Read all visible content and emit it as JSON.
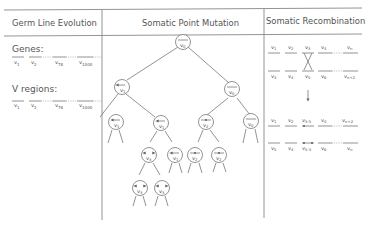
{
  "headers": {
    "germ": "Germ Line Evolution",
    "point": "Somatic Point Mutation",
    "recomb": "Somatic Recombination"
  },
  "germ_line": {
    "genes_label": "Genes:",
    "genes": [
      "v1",
      "v2",
      "v78",
      "v1000"
    ],
    "vregions_label": "V regions:",
    "vregions": [
      "v1",
      "v2",
      "v78",
      "v1000"
    ]
  },
  "point_mutation_tree": {
    "root": {
      "label": "v0",
      "mark": "bar"
    },
    "nodes": [
      {
        "id": "L",
        "label": "v1",
        "mark": "arrow-left"
      },
      {
        "id": "R",
        "label": "v0",
        "mark": "bar"
      },
      {
        "id": "LL",
        "label": "v1",
        "mark": "arrow-left"
      },
      {
        "id": "LR",
        "label": "v1",
        "mark": "arrow-left"
      },
      {
        "id": "RL",
        "label": "v2",
        "mark": "dot"
      },
      {
        "id": "RR",
        "label": "v0",
        "mark": "bar"
      },
      {
        "id": "LRL",
        "label": "v3",
        "mark": "double-arrow"
      },
      {
        "id": "LRR",
        "label": "v1",
        "mark": "arrow-left"
      },
      {
        "id": "RLL",
        "label": "v2",
        "mark": "dot"
      },
      {
        "id": "RLR",
        "label": "v2",
        "mark": "dot"
      },
      {
        "id": "LRLL",
        "label": "v3",
        "mark": "double-arrow"
      },
      {
        "id": "LRLR",
        "label": "v3",
        "mark": "double-arrow"
      }
    ]
  },
  "recombination": {
    "before_top": [
      "v1",
      "v2",
      "v3",
      "v4",
      "vn"
    ],
    "before_bottom": [
      "v3",
      "v4",
      "v5",
      "v6",
      "vn+2"
    ],
    "after_top": [
      "v1",
      "v2",
      "v3-5",
      "v4",
      "vn+2"
    ],
    "after_bottom": [
      "v5",
      "v4",
      "v5-3",
      "v6",
      "vn"
    ]
  }
}
